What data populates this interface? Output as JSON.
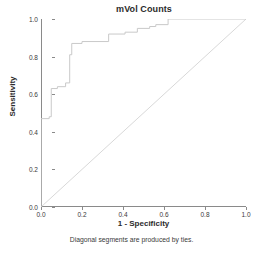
{
  "chart_data": {
    "type": "line",
    "title": "mVol Counts",
    "xlabel": "1 - Specificity",
    "ylabel": "Sensitivity",
    "xlim": [
      0.0,
      1.0
    ],
    "ylim": [
      0.0,
      1.0
    ],
    "grid": false,
    "legend": false,
    "footnote": "Diagonal segments are produced by ties.",
    "xticks": [
      "0.0",
      "0.2",
      "0.4",
      "0.6",
      "0.8",
      "1.0"
    ],
    "xtick_values": [
      0.0,
      0.2,
      0.4,
      0.6,
      0.8,
      1.0
    ],
    "yticks": [
      "0.0",
      "0.2",
      "0.4",
      "0.6",
      "0.8",
      "1.0"
    ],
    "ytick_values": [
      0.0,
      0.2,
      0.4,
      0.6,
      0.8,
      1.0
    ],
    "series": [
      {
        "name": "ROC curve",
        "color": "#c9c9c9",
        "x": [
          0.0,
          0.0,
          0.04,
          0.04,
          0.05,
          0.05,
          0.08,
          0.08,
          0.12,
          0.12,
          0.14,
          0.14,
          0.15,
          0.15,
          0.2,
          0.2,
          0.33,
          0.33,
          0.41,
          0.41,
          0.47,
          0.47,
          0.53,
          0.53,
          0.56,
          0.56,
          0.62,
          0.62,
          1.0
        ],
        "y": [
          0.0,
          0.47,
          0.47,
          0.48,
          0.48,
          0.63,
          0.63,
          0.64,
          0.64,
          0.66,
          0.66,
          0.81,
          0.81,
          0.87,
          0.87,
          0.88,
          0.88,
          0.92,
          0.92,
          0.93,
          0.93,
          0.95,
          0.95,
          0.96,
          0.96,
          0.97,
          0.97,
          1.0,
          1.0
        ]
      },
      {
        "name": "Reference diagonal",
        "color": "#d8d8d8",
        "x": [
          0.0,
          1.0
        ],
        "y": [
          0.0,
          1.0
        ]
      }
    ]
  },
  "figure": {
    "title": "mVol Counts",
    "x_axis_title": "1 - Specificity",
    "y_axis_title": "Sensitivity",
    "footnote": "Diagonal segments are produced by ties."
  }
}
